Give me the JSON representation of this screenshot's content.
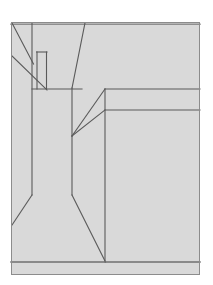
{
  "figure": {
    "kind": "technical-line-drawing",
    "canvas": {
      "width": 213,
      "height": 285
    },
    "colors": {
      "page_background": "#ffffff",
      "panel_fill": "#d9d9d9",
      "panel_border": "#8c8c8c",
      "stroke": "#5a5a5a",
      "stroke_light": "#7d7d7d"
    },
    "panel": {
      "x": 11,
      "y": 22,
      "width": 189,
      "height": 253
    },
    "strokes": {
      "panel_border_width": 1,
      "line_width": 1.1,
      "heavy_line_width": 1.6
    },
    "shapes": [
      {
        "name": "panel-background",
        "type": "rect",
        "x": 11,
        "y": 22,
        "width": 189,
        "height": 253
      },
      {
        "name": "top-edge-highlight",
        "type": "line",
        "points": [
          [
            11,
            24
          ],
          [
            200,
            24
          ]
        ]
      },
      {
        "name": "upper-left-diagonal-outer",
        "type": "line",
        "points": [
          [
            12,
            23
          ],
          [
            33,
            63
          ]
        ]
      },
      {
        "name": "upper-left-diagonal-inner",
        "type": "line",
        "points": [
          [
            12,
            56
          ],
          [
            47,
            90
          ]
        ]
      },
      {
        "name": "left-vertical-upper",
        "type": "line",
        "points": [
          [
            32,
            23
          ],
          [
            32,
            195
          ]
        ]
      },
      {
        "name": "notch-left-side",
        "type": "line",
        "points": [
          [
            37,
            52
          ],
          [
            37,
            89
          ]
        ]
      },
      {
        "name": "notch-top",
        "type": "line",
        "points": [
          [
            37,
            52
          ],
          [
            47,
            52
          ]
        ]
      },
      {
        "name": "notch-right-side",
        "type": "line",
        "points": [
          [
            47,
            52
          ],
          [
            47,
            89
          ]
        ]
      },
      {
        "name": "mid-left-horizontal",
        "type": "line",
        "points": [
          [
            32,
            89
          ],
          [
            82,
            89
          ]
        ]
      },
      {
        "name": "top-center-diagonal",
        "type": "line",
        "points": [
          [
            85,
            23
          ],
          [
            72,
            88
          ]
        ]
      },
      {
        "name": "center-vertical-upper",
        "type": "line",
        "points": [
          [
            72,
            88
          ],
          [
            72,
            136
          ]
        ]
      },
      {
        "name": "fan-diagonal-upper",
        "type": "line",
        "points": [
          [
            72,
            136
          ],
          [
            105,
            89
          ]
        ]
      },
      {
        "name": "fan-diagonal-lower",
        "type": "line",
        "points": [
          [
            72,
            136
          ],
          [
            105,
            110
          ]
        ]
      },
      {
        "name": "right-block-vertical",
        "type": "line",
        "points": [
          [
            105,
            89
          ],
          [
            105,
            262
          ]
        ]
      },
      {
        "name": "right-horizontal-upper",
        "type": "line",
        "points": [
          [
            105,
            89
          ],
          [
            200,
            89
          ]
        ]
      },
      {
        "name": "right-horizontal-lower",
        "type": "line",
        "points": [
          [
            105,
            110
          ],
          [
            200,
            110
          ]
        ]
      },
      {
        "name": "left-lower-diagonal",
        "type": "line",
        "points": [
          [
            32,
            195
          ],
          [
            12,
            225
          ]
        ]
      },
      {
        "name": "center-vertical-lower",
        "type": "line",
        "points": [
          [
            72,
            136
          ],
          [
            72,
            195
          ]
        ]
      },
      {
        "name": "center-lower-diagonal",
        "type": "line",
        "points": [
          [
            72,
            195
          ],
          [
            105,
            262
          ]
        ]
      },
      {
        "name": "bottom-band-top",
        "type": "line",
        "points": [
          [
            11,
            262
          ],
          [
            200,
            262
          ]
        ]
      },
      {
        "name": "panel-outline",
        "type": "rect-outline",
        "x": 11,
        "y": 22,
        "width": 189,
        "height": 253
      }
    ]
  }
}
